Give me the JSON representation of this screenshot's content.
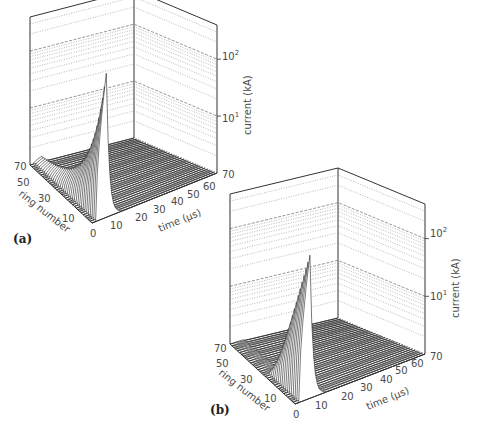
{
  "chart_data": [
    {
      "type": "surface3d",
      "panel_label": "(a)",
      "title": "",
      "x_axis": {
        "label": "time (µs)",
        "ticks": [
          "0",
          "10",
          "20",
          "30",
          "40",
          "50",
          "60",
          "70"
        ],
        "range": [
          0,
          70
        ]
      },
      "y_axis": {
        "label": "ring number",
        "ticks": [
          "10",
          "30",
          "50",
          "70"
        ],
        "range": [
          0,
          70
        ]
      },
      "z_axis": {
        "label": "current (kA)",
        "scale": "log",
        "ticks": [
          "10¹",
          "10²"
        ],
        "range_decades": [
          0,
          2.6
        ]
      },
      "description": "Current pulses per ring; peak rises steeply toward ring 0 at ~8 µs. Ring 70 baseline ~1 kA, ring 0 peak ~300 kA. Pulses confined to t < ~12 µs.",
      "series_peaks": {
        "ring": [
          0,
          5,
          10,
          15,
          20,
          25,
          30,
          35,
          40,
          45,
          50,
          55,
          60,
          65,
          70
        ],
        "peak_current_kA": [
          300,
          150,
          70,
          40,
          25,
          16,
          11,
          8,
          5.5,
          4,
          3,
          2.3,
          1.8,
          1.4,
          1.1
        ]
      }
    },
    {
      "type": "surface3d",
      "panel_label": "(b)",
      "title": "",
      "x_axis": {
        "label": "time (µs)",
        "ticks": [
          "0",
          "10",
          "20",
          "30",
          "40",
          "50",
          "60",
          "70"
        ],
        "range": [
          0,
          70
        ]
      },
      "y_axis": {
        "label": "ring number",
        "ticks": [
          "10",
          "30",
          "50",
          "70"
        ],
        "range": [
          0,
          70
        ]
      },
      "z_axis": {
        "label": "current (kA)",
        "scale": "log",
        "ticks": [
          "10¹",
          "10²"
        ],
        "range_decades": [
          0,
          2.6
        ]
      },
      "description": "Current pulses only for rings 0–~35; rings above ~35 carry negligible current. Peak ~300 kA at ring 0 near ~8 µs.",
      "series_peaks": {
        "ring": [
          0,
          5,
          10,
          15,
          20,
          25,
          30,
          35,
          40,
          50,
          60,
          70
        ],
        "peak_current_kA": [
          300,
          120,
          50,
          22,
          11,
          6,
          3.5,
          2,
          0,
          0,
          0,
          0
        ]
      }
    }
  ],
  "panels": {
    "a": {
      "label": "(a)",
      "xlabel": "time (µs)",
      "ylabel": "ring number",
      "zlabel": "current (kA)",
      "xticks": [
        "0",
        "10",
        "20",
        "30",
        "40",
        "50",
        "60",
        "70"
      ],
      "yticks": [
        "70",
        "50",
        "30",
        "10"
      ],
      "zticks": [
        "10",
        "10"
      ],
      "zticks_exp": [
        "2",
        "1"
      ]
    },
    "b": {
      "label": "(b)",
      "xlabel": "time (µs)",
      "ylabel": "ring number",
      "zlabel": "current (kA)",
      "xticks": [
        "0",
        "10",
        "20",
        "30",
        "40",
        "50",
        "60",
        "70"
      ],
      "yticks": [
        "70",
        "50",
        "30",
        "10"
      ],
      "zticks": [
        "10",
        "10"
      ],
      "zticks_exp": [
        "2",
        "1"
      ]
    }
  },
  "colors": {
    "line": "#333333",
    "grid": "#8a8a8a",
    "text": "#4a4a4a"
  }
}
